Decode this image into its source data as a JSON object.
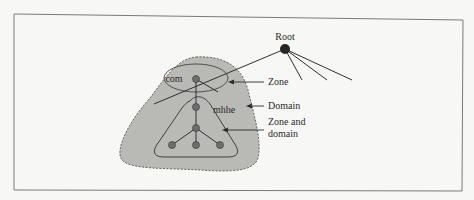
{
  "diagram": {
    "type": "dns-zone-domain",
    "colors": {
      "background": "#f7f7f5",
      "frame": "#7a7a7a",
      "domain_fill": "#b9b9b6",
      "domain_border": "#555555",
      "node_fill": "#6e6e6e",
      "root_fill": "#262626",
      "line": "#2e2e2e",
      "text": "#2a2a2a"
    },
    "nodes": {
      "root": {
        "label": "Root"
      },
      "com": {
        "label": "com"
      },
      "mhhe": {
        "label": "mhhe"
      }
    },
    "annotations": [
      {
        "id": "zone",
        "label": "Zone"
      },
      {
        "id": "domain",
        "label": "Domain"
      },
      {
        "id": "zone_and_domain",
        "label_line1": "Zone and",
        "label_line2": "domain"
      }
    ]
  }
}
